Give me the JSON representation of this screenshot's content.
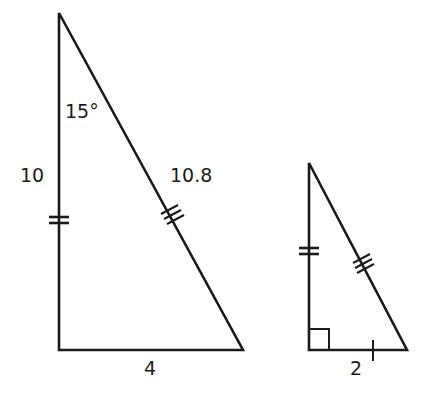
{
  "figure": {
    "stroke_color": "#1a1a1a",
    "background": "#ffffff",
    "large_triangle": {
      "angle_label": "15°",
      "left_side_label": "10",
      "hypotenuse_label": "10.8",
      "base_label": "4",
      "marks": {
        "left_side": "double-tick",
        "hypotenuse": "triple-tick"
      }
    },
    "small_triangle": {
      "base_label": "2",
      "marks": {
        "left_side": "double-tick",
        "hypotenuse": "triple-tick",
        "base": "single-tick",
        "corner": "right-angle"
      }
    }
  }
}
